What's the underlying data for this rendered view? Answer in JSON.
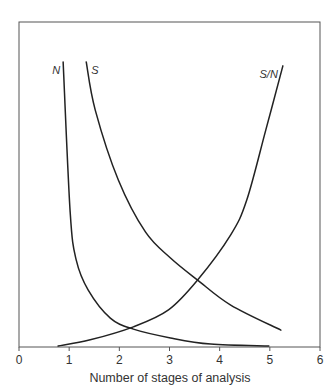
{
  "chart_data": {
    "type": "line",
    "title": "",
    "xlabel": "Number of stages of analysis",
    "ylabel": "",
    "xlim": [
      0,
      6
    ],
    "ylim": [
      0,
      100
    ],
    "x_ticks": [
      "0",
      "1",
      "2",
      "3",
      "4",
      "5",
      "6"
    ],
    "y_ticks": [],
    "grid": false,
    "legend": "inline labels at top of each curve",
    "series": [
      {
        "name": "N",
        "label": "N",
        "x": [
          0.88,
          1.02,
          1.14,
          1.38,
          1.82,
          2.28,
          3.02,
          3.82,
          4.98
        ],
        "y": [
          87.7,
          41.5,
          26.8,
          17.5,
          8.9,
          5.5,
          2.8,
          0.9,
          0.3
        ]
      },
      {
        "name": "S",
        "label": "S",
        "x": [
          1.34,
          1.52,
          1.98,
          2.52,
          3.02,
          3.56,
          4.22,
          5.22
        ],
        "y": [
          87.7,
          72.9,
          51.4,
          35.4,
          27.4,
          20.6,
          12.9,
          5.2
        ]
      },
      {
        "name": "S/N",
        "label": "S/N",
        "x": [
          0.78,
          1.42,
          2.28,
          2.98,
          3.56,
          4.22,
          4.54,
          4.92,
          5.26
        ],
        "y": [
          0.3,
          2.2,
          6.2,
          11.4,
          20.6,
          34.5,
          45.2,
          66.8,
          86.5
        ]
      }
    ]
  },
  "layout": {
    "plot_left": 19,
    "plot_right": 320,
    "plot_top": 22,
    "plot_bottom": 347,
    "line_color": "#222222",
    "frame_color": "#555555"
  }
}
